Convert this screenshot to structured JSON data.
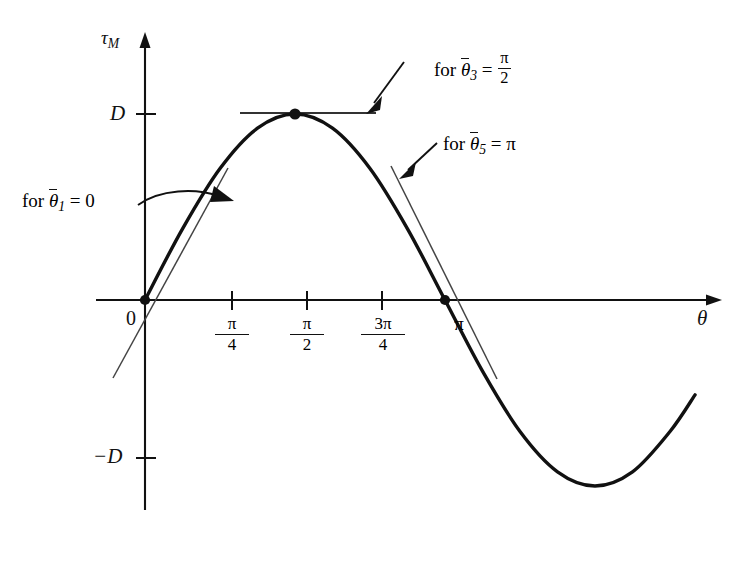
{
  "figure": {
    "axes": {
      "y_axis_label": "τ",
      "y_axis_sub": "M",
      "x_axis_label": "θ",
      "origin_label": "0",
      "y_ticks": [
        {
          "name": "positive-amplitude",
          "label": "D",
          "value": 1
        },
        {
          "name": "negative-amplitude",
          "label": "−D",
          "value": -1
        }
      ],
      "x_ticks": [
        {
          "name": "pi-over-4",
          "num": "π",
          "den": "4",
          "label": "π/4",
          "value": 0.7853981634
        },
        {
          "name": "pi-over-2",
          "num": "π",
          "den": "2",
          "label": "π/2",
          "value": 1.5707963268
        },
        {
          "name": "three-pi-over-4",
          "num": "3π",
          "den": "4",
          "label": "3π/4",
          "value": 2.3561944902
        },
        {
          "name": "pi",
          "num": "π",
          "den": "",
          "label": "π",
          "value": 3.1415926536
        }
      ]
    },
    "annotations": [
      {
        "id": "ann-1",
        "prefix": "for",
        "variable": "θ",
        "subscript": "1",
        "equals": "=",
        "value": "0",
        "value_num": "",
        "value_den": "",
        "full": "for θ̃1 = 0",
        "arrow": "curved"
      },
      {
        "id": "ann-3",
        "prefix": "for",
        "variable": "θ",
        "subscript": "3",
        "equals": "=",
        "value": "",
        "value_num": "π",
        "value_den": "2",
        "full": "for θ̃3 = π/2",
        "arrow": "straight"
      },
      {
        "id": "ann-5",
        "prefix": "for",
        "variable": "θ",
        "subscript": "5",
        "equals": "=",
        "value": "π",
        "value_num": "",
        "value_den": "",
        "full": "for θ̃5 = π",
        "arrow": "straight"
      }
    ]
  },
  "chart_data": {
    "type": "line",
    "title": "",
    "xlabel": "θ",
    "ylabel": "τ_M",
    "xlim": [
      -0.2,
      7.6
    ],
    "ylim": [
      -1.45,
      1.55
    ],
    "grid": false,
    "legend": null,
    "series": [
      {
        "name": "torque-curve",
        "expression": "D sin(θ)",
        "x": [
          0,
          0.3927,
          0.7854,
          1.1781,
          1.5708,
          1.9635,
          2.3562,
          2.7489,
          3.1416,
          3.5343,
          3.927,
          4.3197,
          4.7124,
          5.1051,
          5.4978,
          5.76
        ],
        "y": [
          0,
          0.3827,
          0.7071,
          0.9239,
          1.0,
          0.9239,
          0.7071,
          0.3827,
          0,
          -0.3827,
          -0.7071,
          -0.9239,
          -1.0,
          -0.9239,
          -0.7071,
          -0.51
        ]
      }
    ],
    "markers": [
      {
        "name": "point-theta-1",
        "x": 0,
        "y": 0,
        "label": "θ̃1 = 0"
      },
      {
        "name": "point-theta-3",
        "x": 1.5707963268,
        "y": 1.0,
        "label": "θ̃3 = π/2"
      },
      {
        "name": "point-theta-5",
        "x": 3.1415926536,
        "y": 0,
        "label": "θ̃5 = π"
      }
    ],
    "tangents": [
      {
        "name": "tangent-at-0",
        "at_x": 0,
        "slope": 1,
        "orientation": "rising"
      },
      {
        "name": "tangent-at-pi-over-2",
        "at_x": 1.5708,
        "slope": 0,
        "orientation": "horizontal"
      },
      {
        "name": "tangent-at-pi",
        "at_x": 3.1416,
        "slope": -1,
        "orientation": "falling"
      }
    ],
    "categories": [],
    "values": []
  },
  "colors": {
    "ink": "#111111",
    "curve": "#111111",
    "background": "#ffffff"
  }
}
